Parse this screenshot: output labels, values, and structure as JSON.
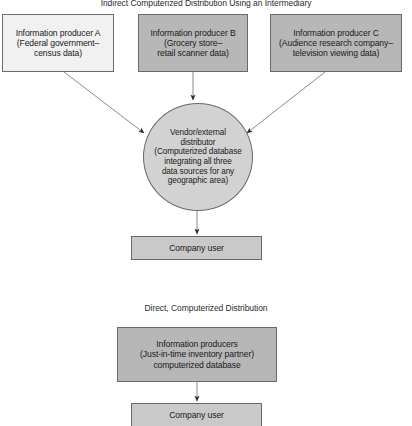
{
  "diagram": {
    "sections": [
      {
        "id": "indirect",
        "title": "Indirect Computerized Distribution Using an Intermediary",
        "nodes": [
          {
            "id": "producer-a",
            "label": "Information producer A\n(Federal government–\ncensus data)",
            "shape": "box",
            "fill": "#f1f1f1"
          },
          {
            "id": "producer-b",
            "label": "Information producer B\n(Grocery store–\nretail scanner data)",
            "shape": "box",
            "fill": "#b7b7b7"
          },
          {
            "id": "producer-c",
            "label": "Information producer C\n(Audience research company–\ntelevision viewing data)",
            "shape": "box",
            "fill": "#b7b7b7"
          },
          {
            "id": "vendor-distributor",
            "label": "Vendor/external\ndistributor\n(Computerized database\nintegrating all three\ndata sources for any\ngeographic area)",
            "shape": "ellipse",
            "fill": "#d2d2d2"
          },
          {
            "id": "company-user-1",
            "label": "Company user",
            "shape": "box",
            "fill": "#c9c9c9"
          }
        ],
        "edges": [
          {
            "from": "producer-a",
            "to": "vendor-distributor"
          },
          {
            "from": "producer-b",
            "to": "vendor-distributor"
          },
          {
            "from": "producer-c",
            "to": "vendor-distributor"
          },
          {
            "from": "vendor-distributor",
            "to": "company-user-1"
          }
        ]
      },
      {
        "id": "direct",
        "title": "Direct, Computerized Distribution",
        "nodes": [
          {
            "id": "information-producers-jit",
            "label": "Information producers\n(Just-in-time inventory partner)\ncomputerized database",
            "shape": "box",
            "fill": "#b7b7b7"
          },
          {
            "id": "company-user-2",
            "label": "Company user",
            "shape": "box",
            "fill": "#c9c9c9"
          }
        ],
        "edges": [
          {
            "from": "information-producers-jit",
            "to": "company-user-2"
          }
        ]
      }
    ],
    "colors": {
      "stroke": "#6a6a6a",
      "arrow": "#3c3c3c",
      "text": "#1a1a1a",
      "background": "#ffffff"
    }
  }
}
